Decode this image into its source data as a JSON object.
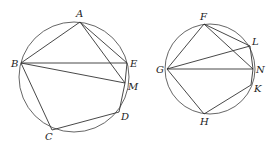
{
  "figures": [
    {
      "name": "left-circle",
      "circle": {
        "cx": 74,
        "cy": 77,
        "r": 55
      },
      "points": {
        "A": {
          "x": 80,
          "y": 22,
          "lx": 76,
          "ly": 17
        },
        "B": {
          "x": 21,
          "y": 63,
          "lx": 11,
          "ly": 67
        },
        "E": {
          "x": 127,
          "y": 63,
          "lx": 130,
          "ly": 67
        },
        "M": {
          "x": 125,
          "y": 83,
          "lx": 128,
          "ly": 90
        },
        "D": {
          "x": 119,
          "y": 112,
          "lx": 121,
          "ly": 120
        },
        "C": {
          "x": 52,
          "y": 130,
          "lx": 45,
          "ly": 140
        }
      },
      "segments": [
        [
          "A",
          "B"
        ],
        [
          "B",
          "E"
        ],
        [
          "A",
          "E"
        ],
        [
          "A",
          "M"
        ],
        [
          "B",
          "M"
        ],
        [
          "E",
          "M"
        ],
        [
          "M",
          "D"
        ],
        [
          "B",
          "C"
        ],
        [
          "C",
          "D"
        ]
      ]
    },
    {
      "name": "right-circle",
      "circle": {
        "cx": 210,
        "cy": 69,
        "r": 45
      },
      "points": {
        "F": {
          "x": 204,
          "y": 24,
          "lx": 200,
          "ly": 20
        },
        "L": {
          "x": 250,
          "y": 46,
          "lx": 252,
          "ly": 45
        },
        "G": {
          "x": 167,
          "y": 69,
          "lx": 156,
          "ly": 73
        },
        "N": {
          "x": 253,
          "y": 69,
          "lx": 256,
          "ly": 73
        },
        "K": {
          "x": 251,
          "y": 85,
          "lx": 254,
          "ly": 92
        },
        "H": {
          "x": 204,
          "y": 114,
          "lx": 200,
          "ly": 125
        }
      },
      "segments": [
        [
          "F",
          "G"
        ],
        [
          "F",
          "L"
        ],
        [
          "F",
          "N"
        ],
        [
          "G",
          "L"
        ],
        [
          "G",
          "N"
        ],
        [
          "L",
          "N"
        ],
        [
          "N",
          "K"
        ],
        [
          "G",
          "H"
        ],
        [
          "H",
          "K"
        ]
      ]
    }
  ],
  "labels": {
    "A": "A",
    "B": "B",
    "C": "C",
    "D": "D",
    "E": "E",
    "M": "M",
    "F": "F",
    "G": "G",
    "H": "H",
    "K": "K",
    "L": "L",
    "N": "N"
  }
}
